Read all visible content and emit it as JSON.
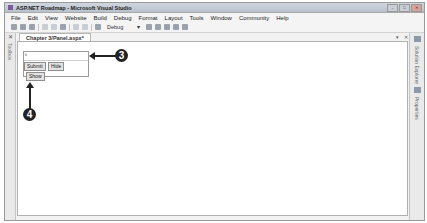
{
  "window": {
    "title": "ASP.NET Roadmap - Microsoft Visual Studio",
    "controls": [
      "minimize",
      "maximize",
      "close"
    ]
  },
  "menubar": {
    "items": [
      "File",
      "Edit",
      "View",
      "Website",
      "Build",
      "Debug",
      "Format",
      "Layout",
      "Tools",
      "Window",
      "Community",
      "Help"
    ]
  },
  "toolbar": {
    "config_combo": "Debug"
  },
  "toolbox": {
    "label": "Toolbox"
  },
  "document": {
    "tab_label": "Chapter 3/Panel.aspx*",
    "pin_glyph": "▾",
    "close_glyph": "✕"
  },
  "designer": {
    "panel_marker": "li",
    "buttons": {
      "submit": "Submit",
      "hide": "Hide",
      "show": "Show"
    }
  },
  "right_panel": {
    "tabs": [
      "Solution Explorer",
      "Properties"
    ]
  },
  "callouts": {
    "three": "3",
    "four": "4"
  }
}
